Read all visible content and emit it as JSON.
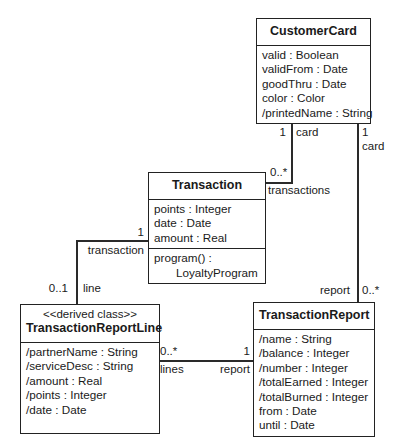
{
  "diagram": {
    "type": "uml-class-diagram",
    "classes": [
      {
        "id": "customer-card",
        "name": "CustomerCard",
        "stereotype": "",
        "attributes": [
          "valid : Boolean",
          "validFrom : Date",
          "goodThru : Date",
          "color : Color",
          "/printedName : String"
        ],
        "operations": []
      },
      {
        "id": "transaction",
        "name": "Transaction",
        "stereotype": "",
        "attributes": [
          "points : Integer",
          "date : Date",
          "amount : Real"
        ],
        "operations": [
          "program() :",
          "LoyaltyProgram"
        ]
      },
      {
        "id": "transaction-report-line",
        "name": "TransactionReportLine",
        "stereotype": "<<derived class>>",
        "attributes": [
          "/partnerName : String",
          "/serviceDesc : String",
          "/amount : Real",
          "/points : Integer",
          "/date : Date"
        ],
        "operations": []
      },
      {
        "id": "transaction-report",
        "name": "TransactionReport",
        "stereotype": "",
        "attributes": [
          "/name : String",
          "/balance : Integer",
          "/number : Integer",
          "/totalEarned : Integer",
          "/totalBurned : Integer",
          "from : Date",
          "until : Date"
        ],
        "operations": []
      }
    ],
    "associations": [
      {
        "id": "card-transactions",
        "from": "customer-card",
        "to": "transaction",
        "from_multiplicity": "1",
        "from_role": "card",
        "to_multiplicity": "0..*",
        "to_role": "transactions"
      },
      {
        "id": "card-report",
        "from": "customer-card",
        "to": "transaction-report",
        "from_multiplicity": "1",
        "from_role": "card",
        "to_multiplicity": "0..*",
        "to_role": "report"
      },
      {
        "id": "transaction-line",
        "from": "transaction",
        "to": "transaction-report-line",
        "from_multiplicity": "1",
        "from_role": "transaction",
        "to_multiplicity": "0..1",
        "to_role": "line"
      },
      {
        "id": "report-lines",
        "from": "transaction-report-line",
        "to": "transaction-report",
        "from_multiplicity": "0..*",
        "from_role": "lines",
        "to_multiplicity": "1",
        "to_role": "report"
      }
    ]
  }
}
